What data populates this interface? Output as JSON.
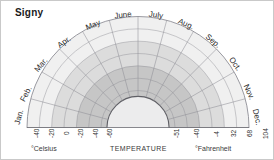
{
  "chart_title": "Signy",
  "axis": {
    "celsius_label": "°Celsius",
    "temperature_label": "TEMPERATURE",
    "fahrenheit_label": "°Fahrenheit"
  },
  "chart_data": {
    "type": "area",
    "subtype": "polar-semicircle-climate-rose",
    "title": "Signy",
    "xlabel": "TEMPERATURE",
    "ylabel": "",
    "grid": true,
    "legend_position": "none",
    "angular_axis": {
      "name": "Month",
      "categories": [
        "Jan.",
        "Feb.",
        "Mar.",
        "Apr.",
        "May",
        "June",
        "July",
        "Aug.",
        "Sep.",
        "Oct.",
        "Nov.",
        "Dec."
      ],
      "start_angle_deg": 180,
      "end_angle_deg": 0,
      "direction": "clockwise"
    },
    "radial_axis": {
      "name": "Temperature",
      "direction": "outward-increasing",
      "celsius_ticks_left": [
        "-40",
        "-20",
        "0",
        "-20",
        "-40",
        "-60"
      ],
      "celsius_ticks": [
        -40,
        -20,
        0,
        -20,
        -40,
        -60
      ],
      "fahrenheit_ticks_right": [
        "-51",
        "-40",
        "-4",
        "32",
        "68",
        "104"
      ],
      "fahrenheit_ticks": [
        -51,
        -40,
        -4,
        32,
        68,
        104
      ],
      "rings": 9,
      "inner_hole_radius_fraction": 0.28
    },
    "bands": [
      {
        "name": "inner-core",
        "fill": "#ececed",
        "from_fraction": 0.0,
        "to_fraction": 0.28
      },
      {
        "name": "mid-dark-band",
        "fill": "#c6c6c6",
        "from_fraction": 0.28,
        "to_fraction": 0.6
      },
      {
        "name": "mid-light-band",
        "fill": "#dcdcdc",
        "from_fraction": 0.6,
        "to_fraction": 0.78
      },
      {
        "name": "outer-pale-band",
        "fill": "#f0f0f0",
        "from_fraction": 0.78,
        "to_fraction": 1.0
      }
    ],
    "series": [
      {
        "name": "Temperature envelope (°C)",
        "categories": [
          "Jan.",
          "Feb.",
          "Mar.",
          "Apr.",
          "May",
          "June",
          "July",
          "Aug.",
          "Sep.",
          "Oct.",
          "Nov.",
          "Dec."
        ],
        "values": [
          0,
          -2,
          -6,
          -10,
          -14,
          -16,
          -17,
          -17,
          -14,
          -8,
          -3,
          -1
        ]
      }
    ]
  },
  "ticks": {
    "celsius": [
      {
        "label": "-40",
        "x": 32,
        "y": 137
      },
      {
        "label": "-20",
        "x": 47,
        "y": 137
      },
      {
        "label": "0",
        "x": 62,
        "y": 134
      },
      {
        "label": "-20",
        "x": 76,
        "y": 137
      },
      {
        "label": "-40",
        "x": 91,
        "y": 137
      },
      {
        "label": "-60",
        "x": 105,
        "y": 137
      }
    ],
    "fahrenheit": [
      {
        "label": "-51",
        "x": 172,
        "y": 137
      },
      {
        "label": "-40",
        "x": 192,
        "y": 137
      },
      {
        "label": "-4",
        "x": 212,
        "y": 136
      },
      {
        "label": "32",
        "x": 229,
        "y": 136
      },
      {
        "label": "68",
        "x": 245,
        "y": 136
      },
      {
        "label": "104",
        "x": 261,
        "y": 138
      }
    ]
  },
  "months": [
    {
      "label": "Jan.",
      "x": 18,
      "y": 116,
      "rotate": -75
    },
    {
      "label": "Feb.",
      "x": 25,
      "y": 93,
      "rotate": -62
    },
    {
      "label": "Mar.",
      "x": 40,
      "y": 64,
      "rotate": -50
    },
    {
      "label": "Apr.",
      "x": 63,
      "y": 41,
      "rotate": -36
    },
    {
      "label": "May",
      "x": 92,
      "y": 24,
      "rotate": -22
    },
    {
      "label": "June",
      "x": 122,
      "y": 14,
      "rotate": -7
    },
    {
      "label": "July",
      "x": 155,
      "y": 14,
      "rotate": 8
    },
    {
      "label": "Aug.",
      "x": 185,
      "y": 23,
      "rotate": 24
    },
    {
      "label": "Sep.",
      "x": 212,
      "y": 40,
      "rotate": 40
    },
    {
      "label": "Oct.",
      "x": 234,
      "y": 63,
      "rotate": 54
    },
    {
      "label": "Nov.",
      "x": 248,
      "y": 91,
      "rotate": 66
    },
    {
      "label": "Dec.",
      "x": 256,
      "y": 116,
      "rotate": 78
    }
  ],
  "colors": {
    "background": "#ffffff",
    "border": "#c9c9c9",
    "grid_line": "#8f8f96",
    "outer_arc": "#6d6d73",
    "text": "#2b2b2b",
    "inner_core": "#ececed",
    "band_dark": "#c6c6c6",
    "band_mid": "#dcdcdc",
    "band_light": "#f0f0f0"
  }
}
